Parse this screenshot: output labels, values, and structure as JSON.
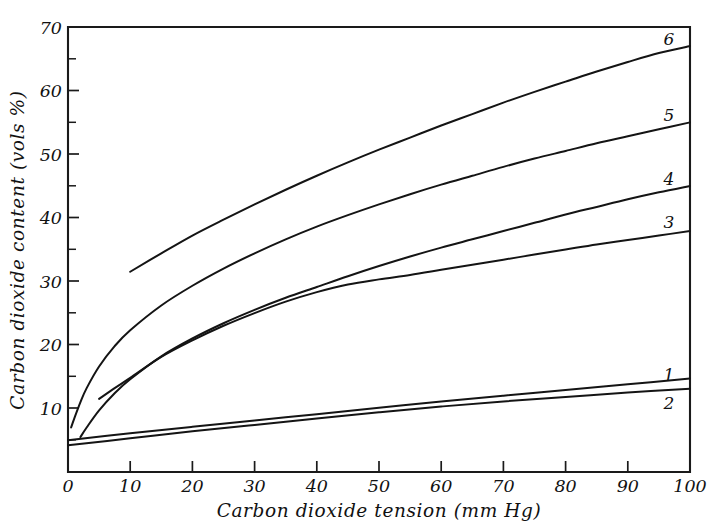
{
  "chart_data": {
    "type": "line",
    "title": "",
    "xlabel": "Carbon dioxide tension (mm Hg)",
    "ylabel": "Carbon dioxide content (vols %)",
    "xlim": [
      0,
      100
    ],
    "ylim": [
      0,
      70
    ],
    "grid": false,
    "legend_position": "right-inline-labels",
    "x_ticks": [
      0,
      10,
      20,
      30,
      40,
      50,
      60,
      70,
      80,
      90,
      100
    ],
    "x_tick_labels": [
      "0",
      "10",
      "20",
      "30",
      "40",
      "50",
      "60",
      "70",
      "80",
      "90",
      "100"
    ],
    "y_ticks": [
      10,
      20,
      30,
      40,
      50,
      60,
      70
    ],
    "y_tick_labels": [
      "10",
      "20",
      "30",
      "40",
      "50",
      "60",
      "70"
    ],
    "y_minor_ticks": [
      5,
      15,
      25,
      35,
      45,
      55,
      65
    ],
    "series": [
      {
        "name": "6",
        "label": "6",
        "label_value": "6",
        "x": [
          10,
          15,
          20,
          25,
          30,
          35,
          40,
          45,
          50,
          55,
          60,
          65,
          70,
          75,
          80,
          85,
          90,
          95,
          100
        ],
        "y": [
          31.5,
          34.4,
          37.2,
          39.7,
          42.1,
          44.4,
          46.6,
          48.7,
          50.7,
          52.6,
          54.5,
          56.3,
          58.1,
          59.8,
          61.4,
          63.0,
          64.5,
          65.9,
          67.0
        ]
      },
      {
        "name": "5",
        "label": "5",
        "label_value": "5",
        "x": [
          0.5,
          1,
          2,
          3,
          5,
          7.5,
          10,
          15,
          20,
          25,
          30,
          35,
          40,
          45,
          50,
          55,
          60,
          65,
          70,
          75,
          80,
          85,
          90,
          95,
          100
        ],
        "y": [
          7.0,
          8.4,
          11.0,
          13.2,
          16.6,
          19.8,
          22.3,
          26.2,
          29.3,
          32.0,
          34.4,
          36.6,
          38.6,
          40.4,
          42.1,
          43.7,
          45.2,
          46.6,
          48.0,
          49.3,
          50.5,
          51.7,
          52.8,
          53.9,
          55.0
        ]
      },
      {
        "name": "4",
        "label": "4",
        "label_value": "4",
        "x": [
          2,
          3,
          5,
          7.5,
          10,
          15,
          20,
          25,
          30,
          35,
          40,
          45,
          50,
          55,
          60,
          65,
          70,
          75,
          80,
          85,
          90,
          95,
          100
        ],
        "y": [
          5.5,
          7.0,
          9.7,
          12.4,
          14.6,
          18.2,
          21.0,
          23.4,
          25.5,
          27.4,
          29.1,
          30.8,
          32.4,
          33.9,
          35.3,
          36.6,
          37.9,
          39.2,
          40.5,
          41.7,
          42.9,
          44.0,
          45.0
        ]
      },
      {
        "name": "3",
        "label": "3",
        "label_value": "3",
        "x": [
          5,
          7.5,
          10,
          15,
          20,
          25,
          30,
          35,
          40,
          45,
          50,
          55,
          60,
          65,
          70,
          75,
          80,
          85,
          90,
          95,
          100
        ],
        "y": [
          11.5,
          13.2,
          14.8,
          18.1,
          20.7,
          23.0,
          25.0,
          26.8,
          28.3,
          29.5,
          30.3,
          31.0,
          31.8,
          32.6,
          33.4,
          34.2,
          35.0,
          35.8,
          36.5,
          37.2,
          37.9
        ]
      },
      {
        "name": "1",
        "label": "1",
        "label_value": "1",
        "x": [
          0,
          10,
          20,
          30,
          40,
          50,
          60,
          70,
          80,
          90,
          100
        ],
        "y": [
          5.0,
          6.1,
          7.1,
          8.1,
          9.1,
          10.1,
          11.1,
          12.0,
          12.9,
          13.8,
          14.7
        ]
      },
      {
        "name": "2",
        "label": "2",
        "label_value": "2",
        "x": [
          0,
          10,
          20,
          30,
          40,
          50,
          60,
          70,
          80,
          90,
          100
        ],
        "y": [
          4.2,
          5.3,
          6.4,
          7.4,
          8.4,
          9.4,
          10.3,
          11.1,
          11.8,
          12.5,
          13.1
        ]
      }
    ]
  },
  "axes": {
    "x_title": "Carbon dioxide tension (mm Hg)",
    "y_title": "Carbon dioxide content (vols %)"
  },
  "x_tick_labels": {
    "t0": "0",
    "t1": "10",
    "t2": "20",
    "t3": "30",
    "t4": "40",
    "t5": "50",
    "t6": "60",
    "t7": "70",
    "t8": "80",
    "t9": "90",
    "t10": "100"
  },
  "y_tick_labels": {
    "t10": "10",
    "t20": "20",
    "t30": "30",
    "t40": "40",
    "t50": "50",
    "t60": "60",
    "t70": "70"
  },
  "curve_labels": {
    "c1": "1",
    "c2": "2",
    "c3": "3",
    "c4": "4",
    "c5": "5",
    "c6": "6"
  },
  "colors": {
    "ink": "#141414",
    "background": "#ffffff"
  }
}
